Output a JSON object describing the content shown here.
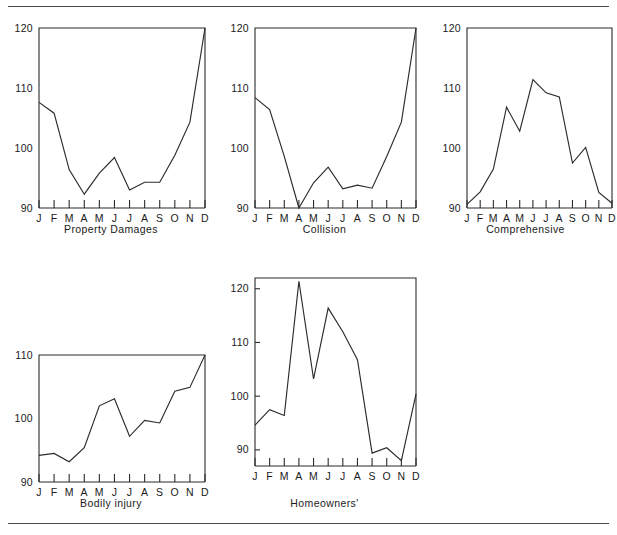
{
  "page": {
    "rules": [
      "top-rule",
      "bottom-rule"
    ],
    "background": "#ffffff",
    "ink": "#2b2b2b"
  },
  "chart_data": [
    {
      "type": "line",
      "title": "Property Damages",
      "xlabel": "",
      "ylabel": "",
      "categories": [
        "J",
        "F",
        "M",
        "A",
        "M",
        "J",
        "J",
        "A",
        "S",
        "O",
        "N",
        "D"
      ],
      "ytick_labels": [
        "90",
        "100",
        "110",
        "120"
      ],
      "yticks": [
        90,
        100,
        110,
        120
      ],
      "ylim": [
        90,
        120
      ],
      "grid": false,
      "legend": "none",
      "values": [
        107.6,
        105.8,
        96.4,
        92.3,
        95.8,
        98.4,
        93.0,
        94.3,
        94.3,
        98.8,
        104.3,
        120.0
      ]
    },
    {
      "type": "line",
      "title": "Collision",
      "xlabel": "",
      "ylabel": "",
      "categories": [
        "J",
        "F",
        "M",
        "A",
        "M",
        "J",
        "J",
        "A",
        "S",
        "O",
        "N",
        "D"
      ],
      "ytick_labels": [
        "90",
        "100",
        "110",
        "120"
      ],
      "yticks": [
        90,
        100,
        110,
        120
      ],
      "ylim": [
        90,
        120
      ],
      "grid": false,
      "legend": "none",
      "values": [
        108.4,
        106.4,
        98.6,
        90.0,
        94.2,
        96.8,
        93.2,
        93.8,
        93.3,
        98.6,
        104.3,
        120.0
      ]
    },
    {
      "type": "line",
      "title": "Comprehensive",
      "xlabel": "",
      "ylabel": "",
      "categories": [
        "J",
        "F",
        "M",
        "A",
        "M",
        "J",
        "J",
        "A",
        "S",
        "O",
        "N",
        "D"
      ],
      "ytick_labels": [
        "90",
        "100",
        "110",
        "120"
      ],
      "yticks": [
        90,
        100,
        110,
        120
      ],
      "ylim": [
        90,
        120
      ],
      "grid": false,
      "legend": "none",
      "values": [
        90.6,
        92.7,
        96.5,
        106.8,
        102.8,
        111.4,
        109.2,
        108.5,
        97.5,
        100.1,
        92.6,
        90.8
      ]
    },
    {
      "type": "line",
      "title": "Bodily injury",
      "xlabel": "",
      "ylabel": "",
      "categories": [
        "J",
        "F",
        "M",
        "A",
        "M",
        "J",
        "J",
        "A",
        "S",
        "O",
        "N",
        "D"
      ],
      "ytick_labels": [
        "90",
        "100",
        "110"
      ],
      "yticks": [
        90,
        100,
        110
      ],
      "ylim": [
        90,
        110
      ],
      "grid": false,
      "legend": "none",
      "values": [
        94.2,
        94.5,
        93.2,
        95.4,
        102.0,
        103.1,
        97.2,
        99.7,
        99.3,
        104.3,
        104.9,
        110.0
      ]
    },
    {
      "type": "line",
      "title": "Homeowners'",
      "xlabel": "",
      "ylabel": "",
      "categories": [
        "J",
        "F",
        "M",
        "A",
        "M",
        "J",
        "J",
        "A",
        "S",
        "O",
        "N",
        "D"
      ],
      "ytick_labels": [
        "90",
        "100",
        "110",
        "120"
      ],
      "yticks": [
        90,
        100,
        110,
        120
      ],
      "ylim": [
        87,
        122
      ],
      "grid": false,
      "legend": "none",
      "values": [
        94.6,
        97.5,
        96.4,
        121.4,
        103.2,
        116.4,
        112.0,
        106.8,
        89.4,
        90.4,
        88.0,
        100.4
      ]
    }
  ]
}
